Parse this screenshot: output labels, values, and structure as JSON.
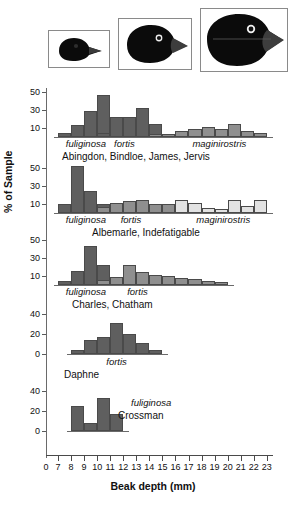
{
  "figure": {
    "x_axis_title": "Beak depth (mm)",
    "y_axis_title": "% of Sample",
    "x_ticks": [
      0,
      7,
      8,
      9,
      10,
      11,
      12,
      13,
      14,
      15,
      16,
      17,
      18,
      19,
      20,
      21,
      22,
      23
    ],
    "colors": {
      "dark_bar": "#5f5f5f",
      "mid_bar": "#8f8f8f",
      "light_bar": "#e2e2e2",
      "bar_outline": "#4a4a4a",
      "axis": "#5a5a5a",
      "text": "#111111"
    }
  },
  "birds": [
    {
      "name": "small-ground-finch-head",
      "alt_label": "fuliginosa"
    },
    {
      "name": "medium-ground-finch-head",
      "alt_label": "fortis"
    },
    {
      "name": "large-ground-finch-head",
      "alt_label": "magnirostris"
    }
  ],
  "chart_data": {
    "type": "bar",
    "title": "",
    "xlabel": "Beak depth (mm)",
    "ylabel": "% of Sample",
    "xlim": [
      6.5,
      23.5
    ],
    "grid": false,
    "legend": "none",
    "note": "Five stacked island-group panels; each panel holds 1-3 species histograms of beak depth, bar width 1 mm.",
    "panels": [
      {
        "location": "Abingdon, Bindloe, James, Jervis",
        "ylim": [
          0,
          58
        ],
        "yticks": [
          10,
          30,
          50
        ],
        "species": [
          {
            "name": "fuliginosa",
            "shade": "dark",
            "label_x": 7.6,
            "x": [
              7,
              8,
              9,
              10,
              11
            ],
            "values": [
              5,
              13,
              29,
              47,
              9
            ]
          },
          {
            "name": "fortis",
            "shade": "dark",
            "label_x": 11.3,
            "x": [
              10,
              11,
              12,
              13,
              14
            ],
            "values": [
              5,
              22,
              22,
              32,
              14
            ]
          },
          {
            "name": "maginirostris",
            "shade": "mid",
            "label_x": 17.3,
            "x": [
              14,
              15,
              16,
              17,
              18,
              19,
              20,
              21,
              22
            ],
            "values": [
              3,
              3,
              7,
              9,
              11,
              9,
              14,
              7,
              4
            ]
          }
        ]
      },
      {
        "location": "Albemarle, Indefatigable",
        "ylim": [
          0,
          58
        ],
        "yticks": [
          10,
          30,
          50
        ],
        "species": [
          {
            "name": "fuliginosa",
            "shade": "dark",
            "label_x": 7.6,
            "x": [
              7,
              8,
              9,
              10
            ],
            "values": [
              10,
              52,
              24,
              10
            ]
          },
          {
            "name": "fortis",
            "shade": "mid",
            "label_x": 11.8,
            "x": [
              10,
              11,
              12,
              13,
              14,
              15,
              16,
              17,
              18
            ],
            "values": [
              7,
              11,
              13,
              15,
              10,
              10,
              7,
              8,
              6
            ]
          },
          {
            "name": "maginirostris",
            "shade": "light",
            "label_x": 17.6,
            "x": [
              16,
              17,
              18,
              19,
              20,
              21,
              22
            ],
            "values": [
              15,
              11,
              6,
              5,
              15,
              8,
              14
            ]
          }
        ]
      },
      {
        "location": "Charles, Chatham",
        "ylim": [
          0,
          58
        ],
        "yticks": [
          10,
          30,
          50
        ],
        "species": [
          {
            "name": "fuliginosa",
            "shade": "dark",
            "label_x": 7.6,
            "x": [
              7,
              8,
              9,
              10,
              11
            ],
            "values": [
              4,
              16,
              43,
              22,
              6
            ]
          },
          {
            "name": "fortis",
            "shade": "mid",
            "label_x": 12.3,
            "x": [
              10,
              11,
              12,
              13,
              14,
              15,
              16,
              17,
              18,
              19
            ],
            "values": [
              6,
              9,
              22,
              15,
              11,
              10,
              8,
              7,
              5,
              3
            ]
          }
        ]
      },
      {
        "location": "Daphne",
        "ylim": [
          0,
          46
        ],
        "yticks": [
          0,
          20,
          40
        ],
        "species": [
          {
            "name": "fortis",
            "shade": "dark",
            "label_x": 10.7,
            "x": [
              8,
              9,
              10,
              11,
              12,
              13,
              14
            ],
            "values": [
              4,
              14,
              17,
              31,
              20,
              11,
              4
            ]
          }
        ]
      },
      {
        "location": "Crossman",
        "ylim": [
          0,
          46
        ],
        "yticks": [
          0,
          20,
          40
        ],
        "species": [
          {
            "name": "fuliginosa",
            "shade": "dark",
            "label_x": 12.6,
            "x": [
              8,
              9,
              10,
              11
            ],
            "values": [
              25,
              8,
              33,
              17
            ]
          }
        ]
      }
    ]
  }
}
